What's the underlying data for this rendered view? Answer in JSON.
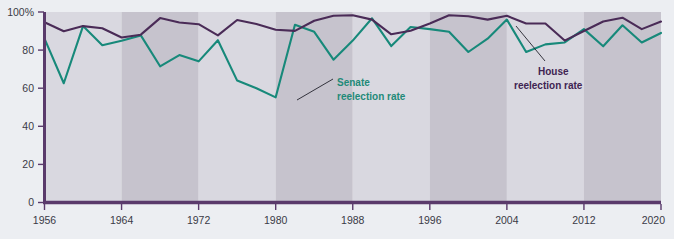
{
  "chart_data": {
    "type": "line",
    "title": "",
    "subtitle": "",
    "xlabel": "",
    "ylabel": "",
    "xlim": [
      1956,
      2020
    ],
    "ylim": [
      0,
      100
    ],
    "grid": false,
    "legend_position": "inline-annotations",
    "x": [
      1956,
      1958,
      1960,
      1962,
      1964,
      1966,
      1968,
      1970,
      1972,
      1974,
      1976,
      1978,
      1980,
      1982,
      1984,
      1986,
      1988,
      1990,
      1992,
      1994,
      1996,
      1998,
      2000,
      2002,
      2004,
      2006,
      2008,
      2010,
      2012,
      2014,
      2016,
      2018,
      2020
    ],
    "x_tick_labels": [
      "1956",
      "1964",
      "1972",
      "1980",
      "1988",
      "1996",
      "2004",
      "2012",
      "2020"
    ],
    "x_tick_values": [
      1956,
      1964,
      1972,
      1980,
      1988,
      1996,
      2004,
      2012,
      2020
    ],
    "y_tick_labels": [
      "0",
      "20",
      "40",
      "60",
      "80",
      "100%"
    ],
    "y_tick_values": [
      0,
      20,
      40,
      60,
      80,
      100
    ],
    "series": [
      {
        "name": "House reelection rate",
        "color": "#4a2b57",
        "values": [
          94.6,
          89.9,
          92.6,
          91.5,
          86.6,
          88.1,
          96.8,
          94.5,
          93.6,
          87.7,
          95.8,
          93.7,
          90.7,
          90.1,
          95.4,
          98.0,
          98.3,
          96.0,
          88.3,
          90.2,
          94.0,
          98.3,
          97.8,
          96.0,
          98.0,
          94.0,
          94.0,
          85.0,
          90.0,
          95.0,
          97.0,
          91.0,
          95.0
        ]
      },
      {
        "name": "Senate reelection rate",
        "color": "#17897a",
        "values": [
          86.0,
          62.6,
          92.6,
          82.6,
          84.9,
          87.7,
          71.5,
          77.4,
          74.1,
          85.2,
          64.0,
          60.0,
          55.2,
          93.3,
          89.6,
          75.0,
          85.0,
          96.7,
          82.1,
          92.1,
          91.0,
          89.6,
          79.0,
          86.0,
          96.0,
          79.0,
          83.0,
          84.0,
          91.0,
          82.0,
          93.0,
          84.0,
          89.0
        ]
      }
    ],
    "bands": [
      {
        "from": 1956,
        "to": 1964,
        "shade": "light"
      },
      {
        "from": 1964,
        "to": 1972,
        "shade": "dark"
      },
      {
        "from": 1972,
        "to": 1980,
        "shade": "light"
      },
      {
        "from": 1980,
        "to": 1988,
        "shade": "dark"
      },
      {
        "from": 1988,
        "to": 1996,
        "shade": "light"
      },
      {
        "from": 1996,
        "to": 2004,
        "shade": "dark"
      },
      {
        "from": 2004,
        "to": 2012,
        "shade": "light"
      },
      {
        "from": 2012,
        "to": 2020,
        "shade": "dark"
      }
    ],
    "annotations": [
      {
        "id": "senate",
        "line1": "Senate",
        "line2": "reelection rate",
        "color": "#17897a"
      },
      {
        "id": "house",
        "line1": "House",
        "line2": "reelection rate",
        "color": "#3f2452"
      }
    ]
  },
  "colors": {
    "background": "#eceef2",
    "band_light": "#d9d8e0",
    "band_dark": "#c6c3cd",
    "axis": "#5a3a6b",
    "house_line": "#4a2b57",
    "senate_line": "#17897a",
    "tick_text": "#3a3a46",
    "leader_line": "#23232d"
  }
}
